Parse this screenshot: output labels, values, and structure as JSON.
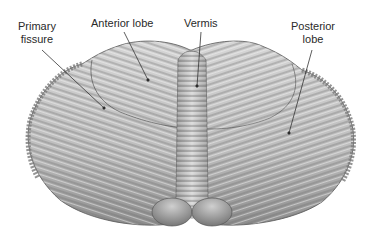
{
  "figure": {
    "colors": {
      "background": "#ffffff",
      "tissue_light": "#d9d9d9",
      "tissue_mid": "#a8a8a8",
      "tissue_dark": "#5a5a5a",
      "label_text": "#2a2a2a",
      "leader_line": "#333333"
    },
    "labels": [
      {
        "id": "primary-fissure",
        "lines": [
          "Primary",
          "fissure"
        ]
      },
      {
        "id": "anterior-lobe",
        "lines": [
          "Anterior lobe"
        ]
      },
      {
        "id": "vermis",
        "lines": [
          "Vermis"
        ]
      },
      {
        "id": "posterior-lobe",
        "lines": [
          "Posterior",
          "lobe"
        ]
      }
    ]
  }
}
